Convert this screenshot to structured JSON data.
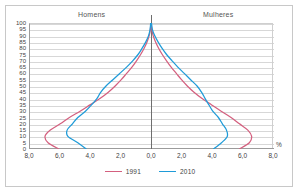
{
  "figure": {
    "top_remnant_text": "",
    "percent_symbol": "%"
  },
  "headers": {
    "left": "Homens",
    "right": "Mulheres"
  },
  "colors": {
    "series_1991": "#d4607f",
    "series_2010": "#1f9bd8",
    "gridline": "#d7d7d7",
    "axis": "#9b9b9b",
    "center_axis": "#6e6e6e",
    "frame": "#c8c8c8",
    "text": "#3f3f3f"
  },
  "legend": {
    "position": "bottom-center",
    "items": [
      {
        "label": "1991",
        "color": "#d4607f"
      },
      {
        "label": "2010",
        "color": "#1f9bd8"
      }
    ]
  },
  "chart_data": {
    "type": "line",
    "subtype": "population-pyramid",
    "title": "",
    "xlabel": "%",
    "ylabel": "",
    "xlim": [
      -8.0,
      8.0
    ],
    "ylim": [
      0,
      100
    ],
    "grid": true,
    "decimal_separator": ",",
    "x_tick_labels": [
      "8,0",
      "6,0",
      "4,0",
      "2,0",
      "0,0",
      "2,0",
      "4,0",
      "6,0",
      "8,0"
    ],
    "x_tick_values": [
      -8,
      -6,
      -4,
      -2,
      0,
      2,
      4,
      6,
      8
    ],
    "y_tick_labels": [
      "100",
      "95",
      "90",
      "85",
      "80",
      "75",
      "70",
      "65",
      "60",
      "55",
      "50",
      "45",
      "40",
      "35",
      "30",
      "25",
      "20",
      "15",
      "10",
      "5",
      "0"
    ],
    "y_tick_values": [
      100,
      95,
      90,
      85,
      80,
      75,
      70,
      65,
      60,
      55,
      50,
      45,
      40,
      35,
      30,
      25,
      20,
      15,
      10,
      5,
      0
    ],
    "ages": [
      0,
      5,
      10,
      15,
      20,
      25,
      30,
      35,
      40,
      45,
      50,
      55,
      60,
      65,
      70,
      75,
      80,
      85,
      90,
      95,
      100
    ],
    "series": [
      {
        "name": "1991",
        "side": "Homens",
        "color": "#d4607f",
        "values": [
          -6.05,
          -6.75,
          -6.95,
          -6.6,
          -5.95,
          -5.35,
          -4.65,
          -4.0,
          -3.35,
          -2.8,
          -2.35,
          -1.95,
          -1.6,
          -1.25,
          -0.95,
          -0.68,
          -0.45,
          -0.26,
          -0.12,
          -0.04,
          -0.01
        ]
      },
      {
        "name": "1991",
        "side": "Mulheres",
        "color": "#d4607f",
        "values": [
          5.8,
          6.45,
          6.6,
          6.35,
          5.8,
          5.25,
          4.6,
          3.98,
          3.35,
          2.82,
          2.38,
          2.0,
          1.66,
          1.32,
          1.02,
          0.74,
          0.5,
          0.3,
          0.14,
          0.05,
          0.01
        ]
      },
      {
        "name": "2010",
        "side": "Homens",
        "color": "#1f9bd8",
        "values": [
          -4.25,
          -4.8,
          -5.45,
          -5.5,
          -5.15,
          -4.8,
          -4.3,
          -3.9,
          -3.55,
          -3.3,
          -2.95,
          -2.5,
          -2.05,
          -1.6,
          -1.2,
          -0.85,
          -0.58,
          -0.34,
          -0.16,
          -0.06,
          -0.02
        ]
      },
      {
        "name": "2010",
        "side": "Mulheres",
        "color": "#1f9bd8",
        "values": [
          4.1,
          4.62,
          5.0,
          4.95,
          4.68,
          4.42,
          4.05,
          3.8,
          3.55,
          3.32,
          3.02,
          2.6,
          2.18,
          1.76,
          1.38,
          1.02,
          0.72,
          0.46,
          0.24,
          0.09,
          0.03
        ]
      }
    ]
  }
}
